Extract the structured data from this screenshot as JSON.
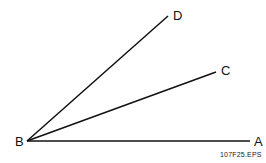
{
  "diagram": {
    "vertex": {
      "label": "B",
      "x": 27,
      "y": 141
    },
    "rays": [
      {
        "label": "A",
        "x": 250,
        "y": 141
      },
      {
        "label": "C",
        "x": 216,
        "y": 72
      },
      {
        "label": "D",
        "x": 168,
        "y": 16
      }
    ],
    "caption": "107F25.EPS",
    "line_color": "#111111"
  }
}
